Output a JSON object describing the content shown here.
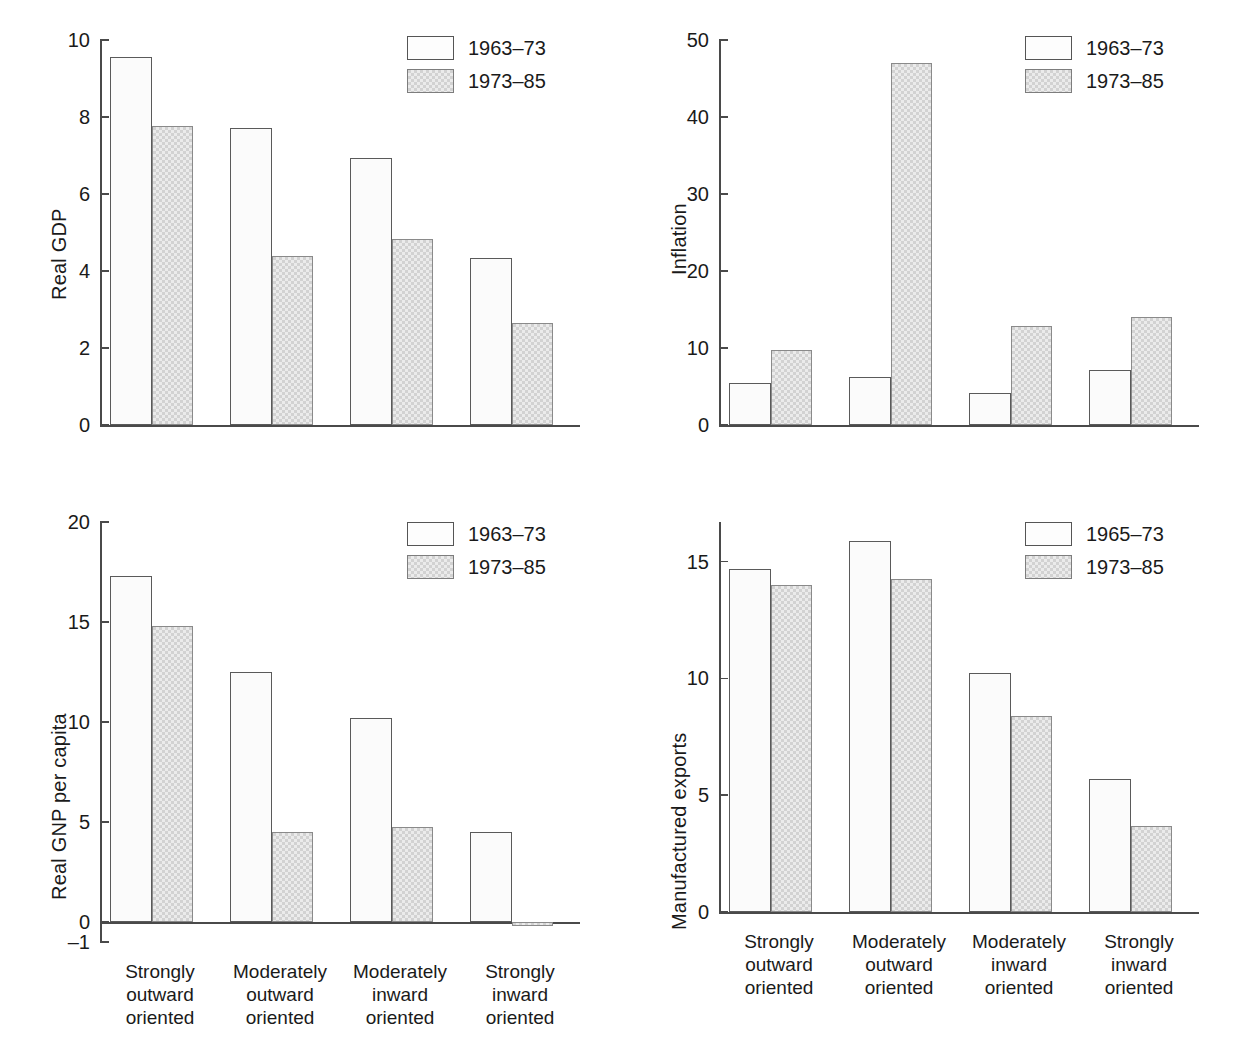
{
  "categories": [
    "Strongly\noutward\noriented",
    "Moderately\noutward\noriented",
    "Moderately\ninward\noriented",
    "Strongly\ninward\noriented"
  ],
  "colors": {
    "series_light_fill": "#fbfbfb",
    "series_shaded_fill": "#d2d2d2",
    "axis": "#4a4a4a",
    "text": "#1a1a1a",
    "background": "#ffffff"
  },
  "chart_data": [
    {
      "id": "real-gdp",
      "type": "bar",
      "title": "",
      "xlabel": "",
      "ylabel": "Real GDP",
      "ylim": [
        0,
        10
      ],
      "yticks": [
        0,
        2,
        4,
        6,
        8,
        10
      ],
      "ytick_labels": [
        "0",
        "2",
        "4",
        "6",
        "8",
        "10"
      ],
      "grid": false,
      "legend_position": "top-right",
      "categories": [
        "Strongly\noutward\noriented",
        "Moderately\noutward\noriented",
        "Moderately\ninward\noriented",
        "Strongly\ninward\noriented"
      ],
      "series": [
        {
          "name": "1963–73",
          "style": "light",
          "values": [
            9.55,
            7.72,
            6.93,
            4.35
          ]
        },
        {
          "name": "1973–85",
          "style": "shaded",
          "values": [
            7.76,
            4.38,
            4.83,
            2.65
          ]
        }
      ]
    },
    {
      "id": "inflation",
      "type": "bar",
      "title": "",
      "xlabel": "",
      "ylabel": "Inflation",
      "ylim": [
        0,
        50
      ],
      "yticks": [
        0,
        10,
        20,
        30,
        40,
        50
      ],
      "ytick_labels": [
        "0",
        "10",
        "20",
        "30",
        "40",
        "50"
      ],
      "grid": false,
      "legend_position": "top-right",
      "categories": [
        "Strongly\noutward\noriented",
        "Moderately\noutward\noriented",
        "Moderately\ninward\noriented",
        "Strongly\ninward\noriented"
      ],
      "series": [
        {
          "name": "1963–73",
          "style": "light",
          "values": [
            5.5,
            6.2,
            4.2,
            7.1
          ]
        },
        {
          "name": "1973–85",
          "style": "shaded",
          "values": [
            9.8,
            47.0,
            12.8,
            14.0
          ]
        }
      ]
    },
    {
      "id": "real-gnp-per-capita",
      "type": "bar",
      "title": "",
      "xlabel": "",
      "ylabel": "Real GNP per capita",
      "ylim": [
        -1,
        20
      ],
      "yticks": [
        -1,
        0,
        5,
        10,
        15,
        20
      ],
      "ytick_labels": [
        "–1",
        "0",
        "5",
        "10",
        "15",
        "20"
      ],
      "grid": false,
      "legend_position": "top-right",
      "categories": [
        "Strongly\noutward\noriented",
        "Moderately\noutward\noriented",
        "Moderately\ninward\noriented",
        "Strongly\ninward\noriented"
      ],
      "series": [
        {
          "name": "1963–73",
          "style": "light",
          "values": [
            17.3,
            12.5,
            10.2,
            4.5
          ]
        },
        {
          "name": "1973–85",
          "style": "shaded",
          "values": [
            14.8,
            4.5,
            4.75,
            -0.2
          ]
        }
      ]
    },
    {
      "id": "manufactured-exports",
      "type": "bar",
      "title": "",
      "xlabel": "",
      "ylabel": "Manufactured exports",
      "ylim": [
        0,
        16.7
      ],
      "yticks": [
        0,
        5,
        10,
        15
      ],
      "ytick_labels": [
        "0",
        "5",
        "10",
        "15"
      ],
      "grid": false,
      "legend_position": "top-right",
      "categories": [
        "Strongly\noutward\noriented",
        "Moderately\noutward\noriented",
        "Moderately\ninward\noriented",
        "Strongly\ninward\noriented"
      ],
      "series": [
        {
          "name": "1965–73",
          "style": "light",
          "values": [
            14.7,
            15.9,
            10.25,
            5.7
          ]
        },
        {
          "name": "1973–85",
          "style": "shaded",
          "values": [
            14.0,
            14.25,
            8.4,
            3.7
          ]
        }
      ]
    }
  ]
}
